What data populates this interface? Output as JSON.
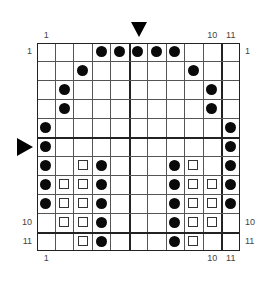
{
  "grid": {
    "rows": 11,
    "cols": 11,
    "thick_after_cols": [
      5,
      10
    ],
    "thick_after_rows": [
      5,
      10
    ],
    "symbols": {
      "circle": "filled-black-circle",
      "square": "open-square"
    },
    "cells": [
      {
        "r": 1,
        "c": 4,
        "t": "circle"
      },
      {
        "r": 1,
        "c": 5,
        "t": "circle"
      },
      {
        "r": 1,
        "c": 6,
        "t": "circle"
      },
      {
        "r": 1,
        "c": 7,
        "t": "circle"
      },
      {
        "r": 1,
        "c": 8,
        "t": "circle"
      },
      {
        "r": 2,
        "c": 3,
        "t": "circle"
      },
      {
        "r": 2,
        "c": 9,
        "t": "circle"
      },
      {
        "r": 3,
        "c": 2,
        "t": "circle"
      },
      {
        "r": 3,
        "c": 10,
        "t": "circle"
      },
      {
        "r": 4,
        "c": 2,
        "t": "circle"
      },
      {
        "r": 4,
        "c": 10,
        "t": "circle"
      },
      {
        "r": 5,
        "c": 1,
        "t": "circle"
      },
      {
        "r": 5,
        "c": 11,
        "t": "circle"
      },
      {
        "r": 6,
        "c": 1,
        "t": "circle"
      },
      {
        "r": 6,
        "c": 11,
        "t": "circle"
      },
      {
        "r": 7,
        "c": 1,
        "t": "circle"
      },
      {
        "r": 7,
        "c": 3,
        "t": "square"
      },
      {
        "r": 7,
        "c": 4,
        "t": "circle"
      },
      {
        "r": 7,
        "c": 8,
        "t": "circle"
      },
      {
        "r": 7,
        "c": 9,
        "t": "square"
      },
      {
        "r": 7,
        "c": 11,
        "t": "circle"
      },
      {
        "r": 8,
        "c": 1,
        "t": "circle"
      },
      {
        "r": 8,
        "c": 2,
        "t": "square"
      },
      {
        "r": 8,
        "c": 3,
        "t": "square"
      },
      {
        "r": 8,
        "c": 4,
        "t": "circle"
      },
      {
        "r": 8,
        "c": 8,
        "t": "circle"
      },
      {
        "r": 8,
        "c": 9,
        "t": "square"
      },
      {
        "r": 8,
        "c": 10,
        "t": "square"
      },
      {
        "r": 8,
        "c": 11,
        "t": "circle"
      },
      {
        "r": 9,
        "c": 1,
        "t": "circle"
      },
      {
        "r": 9,
        "c": 2,
        "t": "square"
      },
      {
        "r": 9,
        "c": 3,
        "t": "square"
      },
      {
        "r": 9,
        "c": 4,
        "t": "circle"
      },
      {
        "r": 9,
        "c": 8,
        "t": "circle"
      },
      {
        "r": 9,
        "c": 9,
        "t": "square"
      },
      {
        "r": 9,
        "c": 10,
        "t": "square"
      },
      {
        "r": 9,
        "c": 11,
        "t": "circle"
      },
      {
        "r": 10,
        "c": 2,
        "t": "square"
      },
      {
        "r": 10,
        "c": 3,
        "t": "square"
      },
      {
        "r": 10,
        "c": 4,
        "t": "circle"
      },
      {
        "r": 10,
        "c": 8,
        "t": "circle"
      },
      {
        "r": 10,
        "c": 9,
        "t": "square"
      },
      {
        "r": 10,
        "c": 10,
        "t": "square"
      },
      {
        "r": 11,
        "c": 3,
        "t": "square"
      },
      {
        "r": 11,
        "c": 4,
        "t": "circle"
      },
      {
        "r": 11,
        "c": 8,
        "t": "circle"
      },
      {
        "r": 11,
        "c": 9,
        "t": "square"
      }
    ]
  },
  "labels": {
    "top": [
      {
        "col": 1,
        "text": "1"
      },
      {
        "col": 10,
        "text": "10"
      },
      {
        "col": 11,
        "text": "11"
      }
    ],
    "bottom": [
      {
        "col": 1,
        "text": "1"
      },
      {
        "col": 10,
        "text": "10"
      },
      {
        "col": 11,
        "text": "11"
      }
    ],
    "left": [
      {
        "row": 1,
        "text": "1"
      },
      {
        "row": 10,
        "text": "10"
      },
      {
        "row": 11,
        "text": "11"
      }
    ],
    "right": [
      {
        "row": 1,
        "text": "1"
      },
      {
        "row": 10,
        "text": "10"
      },
      {
        "row": 11,
        "text": "11"
      }
    ]
  },
  "markers": {
    "top_arrow": {
      "col": 6,
      "icon": "triangle-down-icon"
    },
    "left_arrow": {
      "row": 6,
      "icon": "triangle-right-icon"
    }
  },
  "colors": {
    "ink": "#0a0a0a",
    "grid_line": "#555555",
    "label": "#444444"
  }
}
